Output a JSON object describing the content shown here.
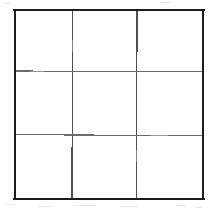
{
  "figure": {
    "name": "three-by-three-grid",
    "rows": 3,
    "columns": 3,
    "cell_count": 9,
    "background_color": "#ffffff",
    "border_color": "#1c1c1c",
    "gridline_color": "#5a5a5a",
    "border_width_px": 2,
    "gridline_width_px": 1,
    "geometry": {
      "left": 14,
      "top": 9,
      "right": 204,
      "bottom": 199,
      "width": 190,
      "height": 190,
      "vertical_gridlines_x": [
        72,
        137
      ],
      "horizontal_gridlines_y": [
        71,
        135
      ]
    },
    "cells": [
      {
        "id": "cell-r1c1",
        "row": 1,
        "column": 1,
        "label": ""
      },
      {
        "id": "cell-r1c2",
        "row": 1,
        "column": 2,
        "label": ""
      },
      {
        "id": "cell-r1c3",
        "row": 1,
        "column": 3,
        "label": ""
      },
      {
        "id": "cell-r2c1",
        "row": 2,
        "column": 1,
        "label": ""
      },
      {
        "id": "cell-r2c2",
        "row": 2,
        "column": 2,
        "label": ""
      },
      {
        "id": "cell-r2c3",
        "row": 2,
        "column": 3,
        "label": ""
      },
      {
        "id": "cell-r3c1",
        "row": 3,
        "column": 1,
        "label": ""
      },
      {
        "id": "cell-r3c2",
        "row": 3,
        "column": 2,
        "label": ""
      },
      {
        "id": "cell-r3c3",
        "row": 3,
        "column": 3,
        "label": ""
      }
    ]
  }
}
